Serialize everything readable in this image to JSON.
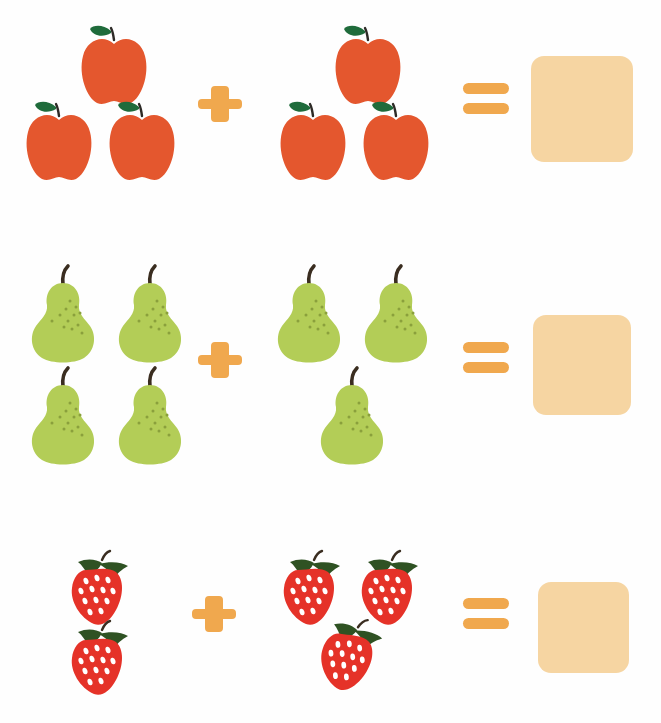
{
  "worksheet": {
    "title": "Fruit Addition Worksheet",
    "background_color": "#fefefe",
    "rows": [
      {
        "id": "row-apples",
        "fruit": "apple",
        "fruit_label": "apple",
        "left_count": 3,
        "right_count": 3,
        "operator": "+",
        "operator_name": "plus-sign",
        "equals": "=",
        "equals_name": "equals-sign",
        "answer": "",
        "answer_placeholder": "",
        "equation_text": "3 + 3 =",
        "colors": {
          "body": "#e4572e",
          "leaf": "#1f6b3b",
          "stem": "#2d2a26"
        }
      },
      {
        "id": "row-pears",
        "fruit": "pear",
        "fruit_label": "pear",
        "left_count": 4,
        "right_count": 3,
        "operator": "+",
        "operator_name": "plus-sign",
        "equals": "=",
        "equals_name": "equals-sign",
        "answer": "",
        "answer_placeholder": "",
        "equation_text": "4 + 3 =",
        "colors": {
          "body": "#b3cd57",
          "speckle": "#8aa03c",
          "stem": "#3a2d20"
        }
      },
      {
        "id": "row-strawberries",
        "fruit": "strawberry",
        "fruit_label": "strawberry",
        "left_count": 2,
        "right_count": 3,
        "operator": "+",
        "operator_name": "plus-sign",
        "equals": "=",
        "equals_name": "equals-sign",
        "answer": "",
        "answer_placeholder": "",
        "equation_text": "2 + 3 =",
        "colors": {
          "body": "#e53228",
          "leaf": "#2f5223",
          "seed": "#ffffff"
        }
      }
    ],
    "palette": {
      "operator_orange": "#f0a84e",
      "answer_box_fill": "#f6d5a2",
      "apple_red": "#e4572e",
      "pear_green": "#b3cd57",
      "strawberry_red": "#e53228",
      "leaf_green": "#1f6b3b",
      "stem_brown": "#3a2d20"
    }
  }
}
